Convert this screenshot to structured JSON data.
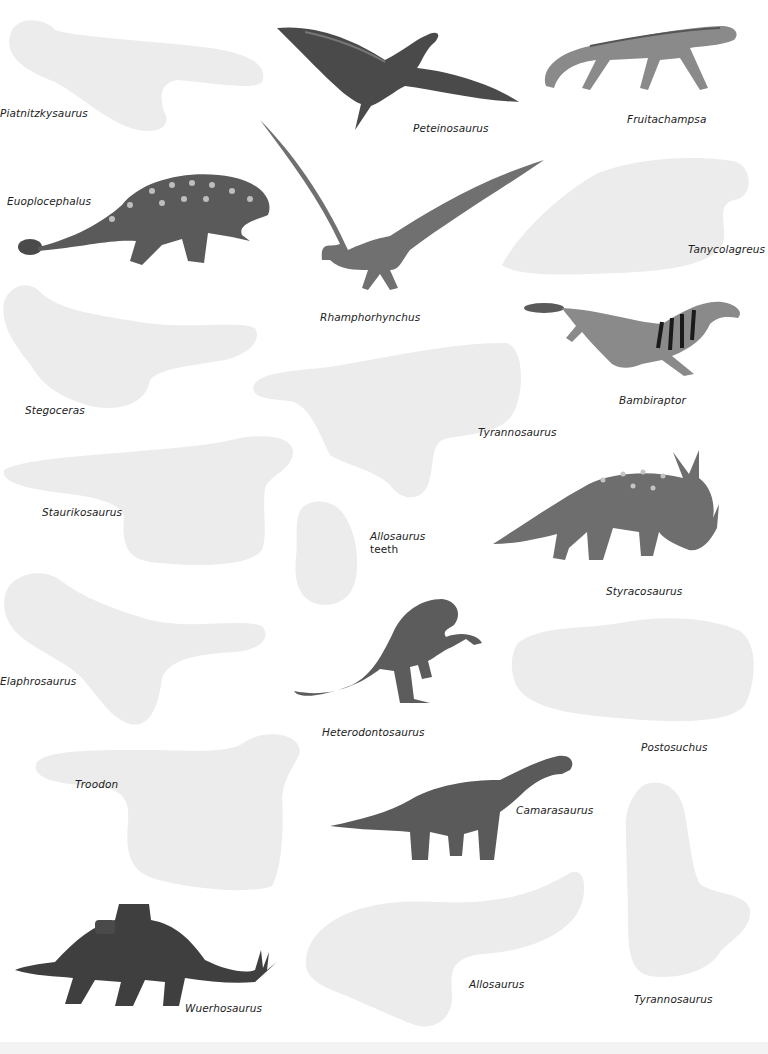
{
  "page": {
    "background": "#ffffff",
    "placeholder_color": "#ececec"
  },
  "stickers": {
    "placeholders": [
      {
        "label": "Piatnitzkysaurus"
      },
      {
        "label": "Tanycolagreus"
      },
      {
        "label": "Stegoceras"
      },
      {
        "label": "Tyrannosaurus"
      },
      {
        "label": "Staurikosaurus"
      },
      {
        "label": "Allosaurus",
        "label_line2": "teeth"
      },
      {
        "label": "Elaphrosaurus"
      },
      {
        "label": "Postosuchus"
      },
      {
        "label": "Troodon"
      },
      {
        "label": "Allosaurus"
      },
      {
        "label": "Tyrannosaurus"
      }
    ],
    "illustrations": [
      {
        "label": "Peteinosaurus",
        "icon": "pterosaur-icon"
      },
      {
        "label": "Fruitachampsa",
        "icon": "crocodylomorph-icon"
      },
      {
        "label": "Euoplocephalus",
        "icon": "ankylosaur-icon"
      },
      {
        "label": "Rhamphorhynchus",
        "icon": "pterosaur-icon"
      },
      {
        "label": "Bambiraptor",
        "icon": "raptor-icon"
      },
      {
        "label": "Styracosaurus",
        "icon": "ceratopsian-icon"
      },
      {
        "label": "Heterodontosaurus",
        "icon": "ornithopod-icon"
      },
      {
        "label": "Camarasaurus",
        "icon": "sauropod-icon"
      },
      {
        "label": "Wuerhosaurus",
        "icon": "stegosaur-icon"
      }
    ]
  }
}
